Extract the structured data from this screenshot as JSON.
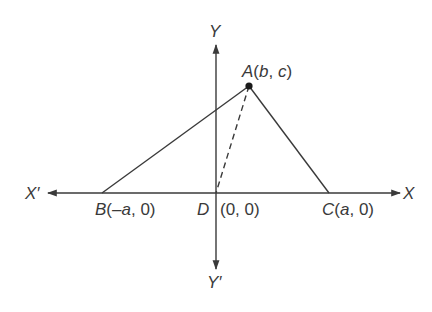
{
  "figure": {
    "type": "coordinate-geometry-diagram",
    "colors": {
      "line": "#3a3a3a",
      "text": "#3a3a3a",
      "background": "#ffffff"
    },
    "axes": {
      "x_label": "X",
      "x_neg_label": "X′",
      "y_label": "Y",
      "y_neg_label": "Y′"
    },
    "points": {
      "A": {
        "name": "A",
        "coords": "(b, c)",
        "open": "(",
        "x": "b",
        "sep": ", ",
        "y": "c",
        "close": ")"
      },
      "B": {
        "name": "B",
        "coords": "(–a, 0)",
        "open": "(",
        "x": "–a",
        "sep": ", ",
        "y": "0",
        "close": ")"
      },
      "C": {
        "name": "C",
        "coords": "(a, 0)",
        "open": "(",
        "x": "a",
        "sep": ", ",
        "y": "0",
        "close": ")"
      },
      "D": {
        "name": "D",
        "coords": "(0, 0)"
      }
    },
    "segments": [
      {
        "from": "A",
        "to": "B",
        "style": "solid"
      },
      {
        "from": "A",
        "to": "C",
        "style": "solid"
      },
      {
        "from": "A",
        "to": "D",
        "style": "dashed"
      }
    ]
  }
}
